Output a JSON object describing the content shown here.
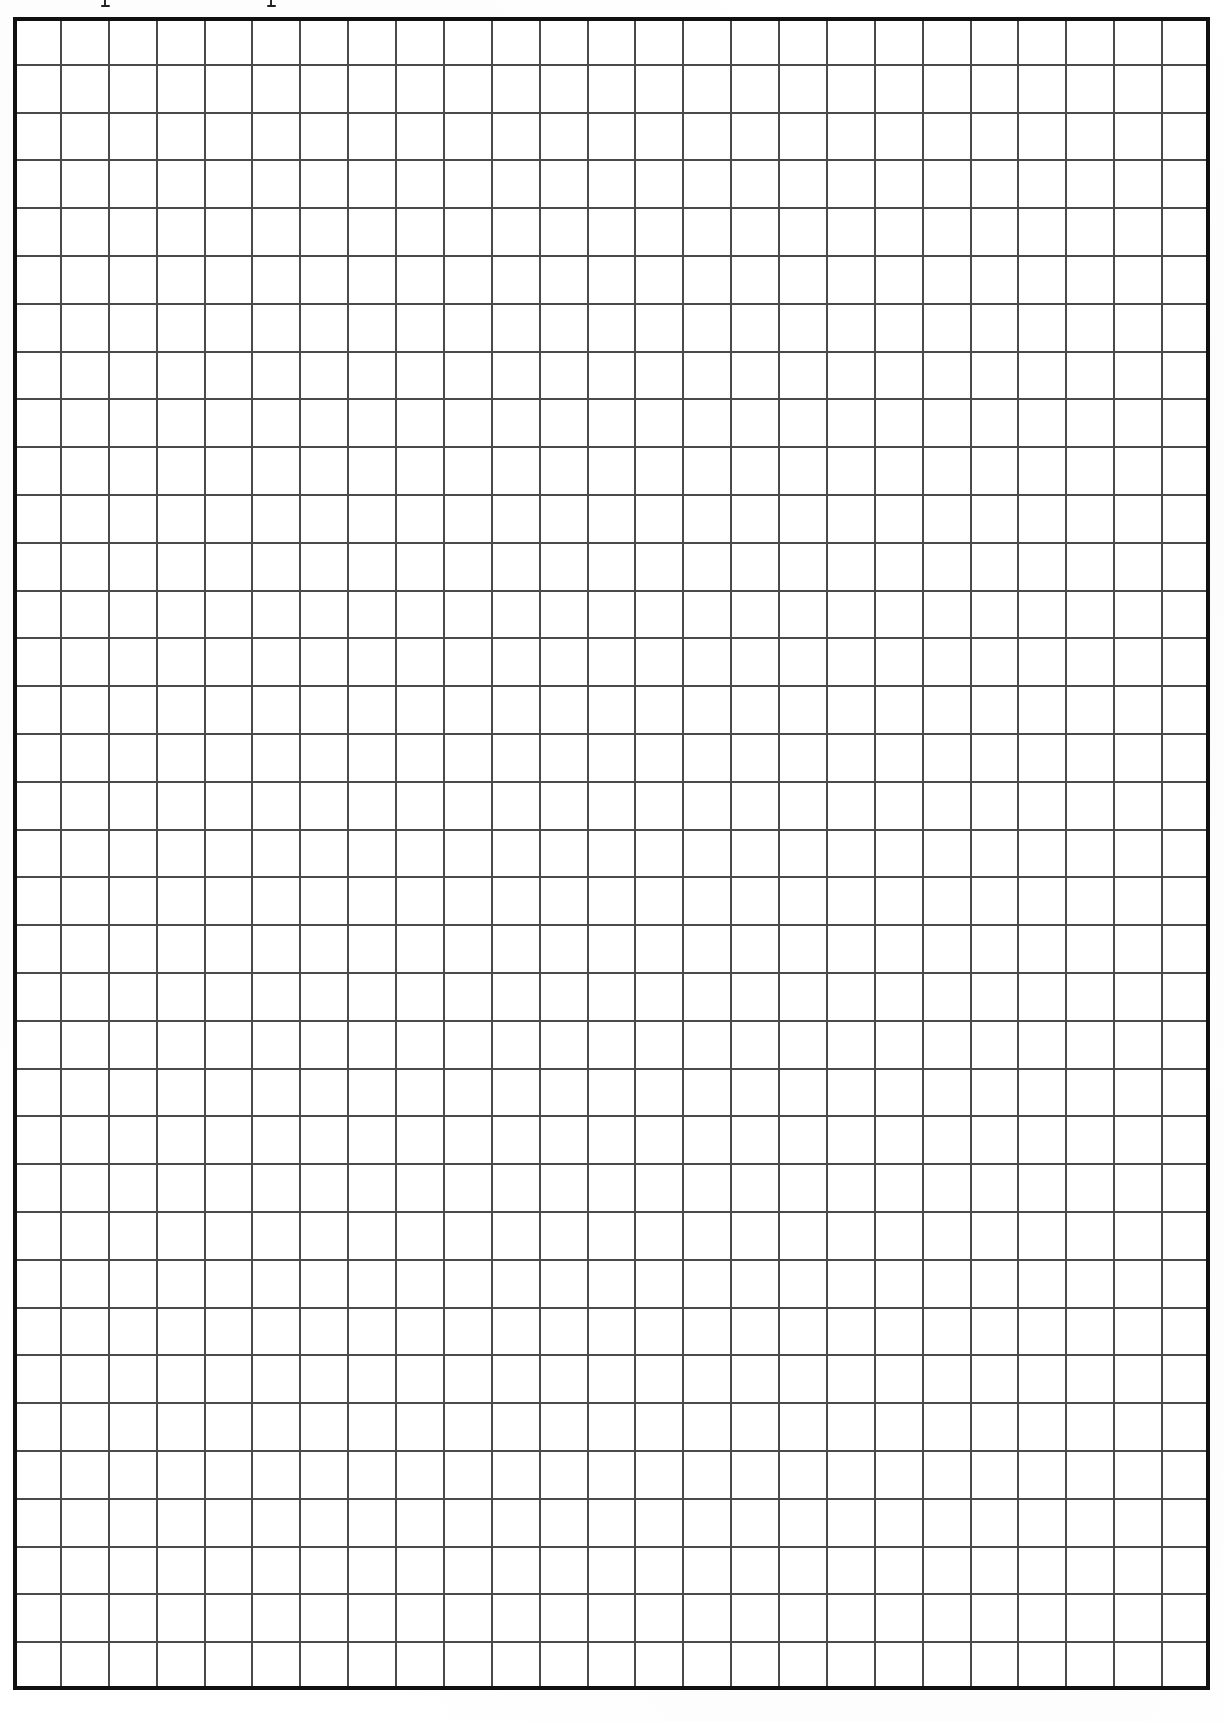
{
  "document": {
    "kind": "grid-paper-scan",
    "title": "Blank Grid Paper",
    "caption": "",
    "background_color": "#ffffff",
    "page_width": 1224,
    "page_height": 1722
  },
  "grid": {
    "columns": 25,
    "rows": 35,
    "cell_width": 47.9,
    "cell_height": 47.8,
    "origin_x": 13,
    "origin_y": 17,
    "width": 1197,
    "height": 1673,
    "line_color": "#4a4a4a",
    "line_width": 2,
    "border_color": "#111111",
    "border_width": 4,
    "cell_fill": "#ffffff",
    "label": "blank grid"
  },
  "artifacts": {
    "top_marks_label": "cut-off ink descender",
    "top_marks": [
      {
        "x": 101,
        "y": 0
      },
      {
        "x": 267,
        "y": 0
      }
    ]
  }
}
